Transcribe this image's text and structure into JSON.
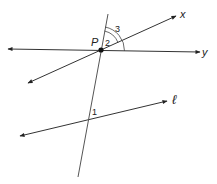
{
  "diagram": {
    "type": "geometry-lines-and-angles",
    "point": {
      "label": "P",
      "x": 101,
      "y": 50
    },
    "lines": [
      {
        "name": "y",
        "label": "y",
        "from": [
          8,
          49
        ],
        "to": [
          200,
          52
        ],
        "arrows": "both"
      },
      {
        "name": "x",
        "label": "x",
        "from": [
          28,
          83
        ],
        "to": [
          176,
          16
        ],
        "arrows": "both"
      },
      {
        "name": "l",
        "label": "ℓ",
        "from": [
          20,
          136
        ],
        "to": [
          167,
          101
        ],
        "arrows": "both"
      },
      {
        "name": "transversal",
        "label": "",
        "from": [
          108,
          14
        ],
        "to": [
          78,
          177
        ],
        "arrows": "none"
      }
    ],
    "angles": [
      {
        "label": "1"
      },
      {
        "label": "2"
      },
      {
        "label": "3"
      }
    ]
  },
  "labels": {
    "point_p": "P",
    "line_x": "x",
    "line_y": "y",
    "line_l": "ℓ",
    "angle_1": "1",
    "angle_2": "2",
    "angle_3": "3"
  },
  "colors": {
    "line": "#333333",
    "text": "#222222",
    "background": "#ffffff"
  }
}
